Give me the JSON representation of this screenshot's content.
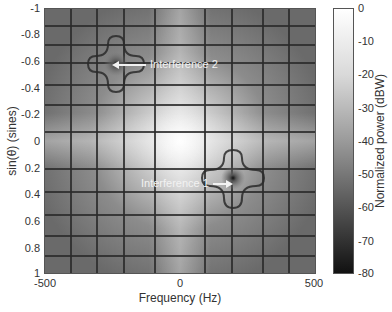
{
  "chart_data": {
    "type": "heatmap",
    "title": "",
    "xlabel": "Frequency (Hz)",
    "ylabel": "sin(θ) (sines)",
    "xlim": [
      -500,
      500
    ],
    "ylim": [
      -1,
      1
    ],
    "x_ticks": [
      "-500",
      "0",
      "500"
    ],
    "y_ticks": [
      "-1",
      "-0.8",
      "-0.6",
      "-0.4",
      "-0.2",
      "0",
      "0.2",
      "0.4",
      "0.6",
      "0.8",
      "1"
    ],
    "colorbar": {
      "label": "Normalized power (dBW)",
      "range": [
        -80,
        0
      ],
      "ticks": [
        "0",
        "-10",
        "-20",
        "-30",
        "-40",
        "-50",
        "-60",
        "-70",
        "-80"
      ],
      "colormap": "gray"
    },
    "peak": {
      "frequency_hz": 0,
      "sin_theta": 0,
      "power_dbw": 0
    },
    "annotations": [
      {
        "text": "Interference 2",
        "frequency_hz": -270,
        "sin_theta": -0.57,
        "type": "null"
      },
      {
        "text": "Interference 1",
        "frequency_hz": 240,
        "sin_theta": 0.35,
        "type": "null"
      }
    ],
    "grid": false,
    "legend_position": "none"
  },
  "labels": {
    "xlabel": "Frequency (Hz)",
    "ylabel": "sin(θ) (sines)",
    "cblabel": "Normalized power (dBW)",
    "ann1": "Interference 1",
    "ann2": "Interference 2"
  }
}
